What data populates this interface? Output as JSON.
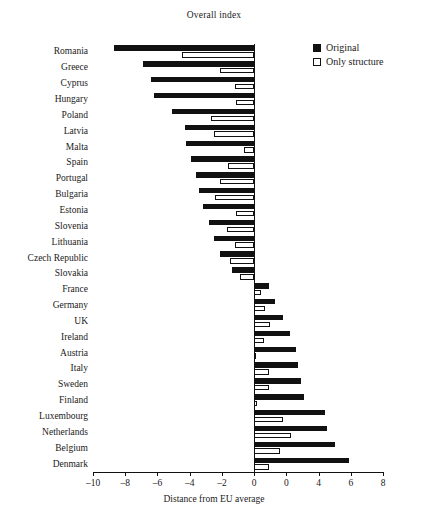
{
  "chart_data": {
    "type": "bar",
    "orientation": "horizontal",
    "title": "Overall index",
    "xlabel": "Distance from EU average",
    "ylabel": "",
    "xlim": [
      -10,
      8
    ],
    "xticks": [
      -10,
      -8,
      -6,
      -4,
      -2,
      0,
      2,
      4,
      6,
      8
    ],
    "xticklabels": [
      "–10",
      "–8",
      "–6",
      "–4",
      "–2",
      "0",
      "0",
      "4",
      "6",
      "8"
    ],
    "grid": false,
    "legend_position": "top-right",
    "legend": [
      "Original",
      "Only structure"
    ],
    "categories": [
      "Romania",
      "Greece",
      "Cyprus",
      "Hungary",
      "Poland",
      "Latvia",
      "Malta",
      "Spain",
      "Portugal",
      "Bulgaria",
      "Estonia",
      "Slovenia",
      "Lithuania",
      "Czech Republic",
      "Slovakia",
      "France",
      "Germany",
      "UK",
      "Ireland",
      "Austria",
      "Italy",
      "Sweden",
      "Finland",
      "Luxembourg",
      "Netherlands",
      "Belgium",
      "Denmark"
    ],
    "series": [
      {
        "name": "Original",
        "color": "#111111",
        "values": [
          -8.7,
          -6.9,
          -6.4,
          -6.2,
          -5.1,
          -4.3,
          -4.2,
          -3.9,
          -3.6,
          -3.4,
          -3.2,
          -2.8,
          -2.5,
          -2.1,
          -1.4,
          0.9,
          1.3,
          1.8,
          2.2,
          2.6,
          2.7,
          2.9,
          3.1,
          4.4,
          4.5,
          5.0,
          5.9
        ]
      },
      {
        "name": "Only structure",
        "color": "#ffffff",
        "values": [
          -4.5,
          -2.1,
          -1.2,
          -1.1,
          -2.7,
          -2.5,
          -0.6,
          -1.6,
          -2.1,
          -2.4,
          -1.1,
          -1.7,
          -1.2,
          -1.5,
          -0.9,
          0.4,
          0.7,
          1.0,
          0.6,
          0.1,
          0.9,
          0.9,
          0.2,
          1.8,
          2.3,
          1.6,
          0.9
        ]
      }
    ]
  }
}
